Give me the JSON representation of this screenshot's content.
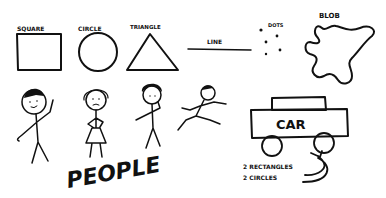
{
  "shapes": {
    "square": "SQUARE",
    "circle": "CIRCLE",
    "triangle": "TRIANGLE",
    "line": "LINE",
    "dots": "DOTS",
    "blob": "BLOB"
  },
  "people": {
    "label": "PEOPLE"
  },
  "car": {
    "label": "CAR",
    "note_line1": "2 RECTANGLES",
    "note_line2": "2 CIRCLES"
  },
  "colors": {
    "ink": "#111111",
    "paper": "#ffffff"
  }
}
